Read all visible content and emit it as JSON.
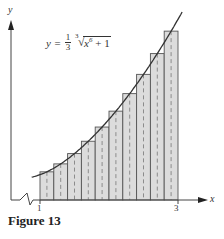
{
  "figure": {
    "caption": "Figure 13",
    "formula": {
      "lhs": "y =",
      "coef_num": "1",
      "coef_den": "3",
      "root_index": "3",
      "radicand_base": "x",
      "radicand_exp": "6",
      "radicand_tail": " + 1"
    },
    "axis_labels": {
      "x": "x",
      "y": "y"
    },
    "tick_labels": {
      "left": "1",
      "right": "3"
    }
  },
  "chart_data": {
    "type": "bar",
    "title": "Figure 13",
    "function": "y = (1/3) * cbrt(x^6 + 1)",
    "method": "midpoint Riemann sum",
    "interval": [
      1,
      3
    ],
    "n": 10,
    "xlabel": "x",
    "ylabel": "y",
    "x_ticks": [
      1,
      3
    ],
    "midpoints": [
      1.1,
      1.3,
      1.5,
      1.7,
      1.9,
      2.1,
      2.3,
      2.5,
      2.7,
      2.9
    ],
    "values": [
      0.468,
      0.6,
      0.771,
      0.976,
      1.212,
      1.476,
      1.767,
      2.087,
      2.432,
      2.805
    ],
    "grid": false,
    "legend": "none",
    "colors": {
      "fill": "#dcdcdc",
      "stroke": "#555555",
      "curve": "#333333",
      "dash": "#777777"
    }
  }
}
